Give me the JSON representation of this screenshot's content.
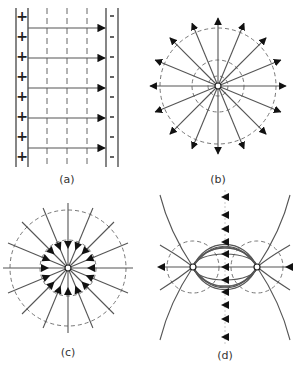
{
  "figure": {
    "panels": [
      {
        "id": "a",
        "label": "(a)",
        "description": "Uniform field between oppositely charged parallel plates",
        "left_plate_sign": "+",
        "right_plate_sign": "-",
        "plus_count": 8,
        "minus_count": 8,
        "field_arrows": 5,
        "equipotential_lines": 3
      },
      {
        "id": "b",
        "label": "(b)",
        "description": "Radial field lines outward from a positive point charge",
        "radial_lines": 16,
        "arrow_direction": "outward",
        "equipotential_circles": 3
      },
      {
        "id": "c",
        "label": "(c)",
        "description": "Radial field lines inward toward a negative point charge",
        "radial_lines": 16,
        "arrow_direction": "inward",
        "equipotential_circles": 2
      },
      {
        "id": "d",
        "label": "(d)",
        "description": "Dipole field between two opposite charges",
        "charges": 2
      }
    ],
    "colors": {
      "line": "#555555",
      "arrow": "#111111",
      "dashed": "#777777"
    }
  }
}
